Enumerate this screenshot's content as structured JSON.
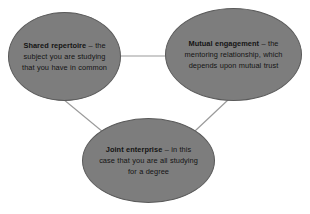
{
  "diagram": {
    "background_color": "#ffffff",
    "node_fill_color": "#7d7d7d",
    "node_border_color": "#5a5a5a",
    "connector_color": "#9a9a9a",
    "text_color": "#141414",
    "nodes": [
      {
        "id": "shared-repertoire",
        "term": "Shared repertoire",
        "dash": " – ",
        "description": "the subject you are studying that you have in common"
      },
      {
        "id": "mutual-engagement",
        "term": "Mutual engagement",
        "dash": " – ",
        "description": "the mentoring relationship, which depends upon mutual trust"
      },
      {
        "id": "joint-enterprise",
        "term": "Joint enterprise",
        "dash": " – ",
        "description": "in this case that you are all studying for a degree"
      }
    ],
    "connectors": [
      {
        "id": "shared-to-mutual",
        "from": "shared-repertoire",
        "to": "mutual-engagement"
      },
      {
        "id": "shared-to-joint",
        "from": "shared-repertoire",
        "to": "joint-enterprise"
      },
      {
        "id": "mutual-to-joint",
        "from": "mutual-engagement",
        "to": "joint-enterprise"
      }
    ]
  }
}
